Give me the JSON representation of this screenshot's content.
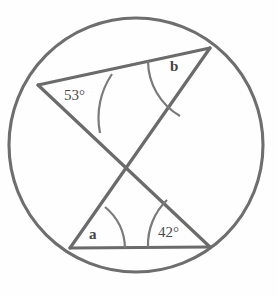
{
  "figure": {
    "type": "circle-geometry-diagram",
    "colors": {
      "circle_stroke": "#6e6e6e",
      "chord_stroke": "#6b6b6b",
      "arc_stroke": "#7a7a7a",
      "label_text": "#4a4a4a",
      "background": "#fefefe"
    },
    "circle": {
      "center_x": 136,
      "center_y": 145,
      "radius": 127
    },
    "points": {
      "left": {
        "name": "L",
        "x": 38,
        "y": 85
      },
      "top_right": {
        "name": "TR",
        "x": 210,
        "y": 48
      },
      "bottom_left": {
        "name": "BL",
        "x": 70,
        "y": 248
      },
      "bottom_right": {
        "name": "BR",
        "x": 210,
        "y": 247
      },
      "intersection": {
        "name": "X",
        "x": 128,
        "y": 167
      }
    },
    "chords": [
      {
        "name": "top-chord",
        "from": "left",
        "to": "top_right"
      },
      {
        "name": "bottom-chord",
        "from": "bottom_left",
        "to": "bottom_right"
      },
      {
        "name": "diagonal-chord-1",
        "from": "left",
        "to": "bottom_right"
      },
      {
        "name": "diagonal-chord-2",
        "from": "bottom_left",
        "to": "top_right"
      }
    ],
    "angles": [
      {
        "name": "angle-at-left",
        "vertex": "left",
        "label": "53°",
        "value": 53,
        "known": true
      },
      {
        "name": "angle-at-top-right",
        "vertex": "top_right",
        "label": "b",
        "value": null,
        "known": false
      },
      {
        "name": "angle-at-bottom-left",
        "vertex": "bottom_left",
        "label": "a",
        "value": null,
        "known": false
      },
      {
        "name": "angle-at-bottom-right",
        "vertex": "bottom_right",
        "label": "42°",
        "value": 42,
        "known": true
      }
    ]
  },
  "labels": {
    "angle_left": "53°",
    "angle_top_right": "b",
    "angle_bottom_left": "a",
    "angle_bottom_right": "42°"
  }
}
